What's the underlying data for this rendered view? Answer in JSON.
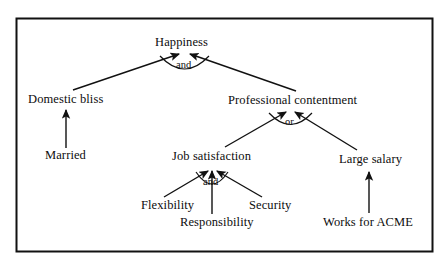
{
  "figure": {
    "kind": "goal-tree-diagram",
    "border_color": "#111111",
    "line_color": "#111111",
    "background": "#ffffff"
  },
  "nodes": {
    "happiness": {
      "label": "Happiness"
    },
    "domestic_bliss": {
      "label": "Domestic bliss"
    },
    "professional_contentment": {
      "label": "Professional contentment"
    },
    "married": {
      "label": "Married"
    },
    "job_satisfaction": {
      "label": "Job satisfaction"
    },
    "large_salary": {
      "label": "Large salary"
    },
    "flexibility": {
      "label": "Flexibility"
    },
    "responsibility": {
      "label": "Responsibility"
    },
    "security": {
      "label": "Security"
    },
    "works_for_acme": {
      "label": "Works for ACME"
    }
  },
  "connectors": {
    "happiness_and": {
      "label": "and"
    },
    "professional_or": {
      "label": "or"
    },
    "job_and": {
      "label": "and"
    }
  }
}
